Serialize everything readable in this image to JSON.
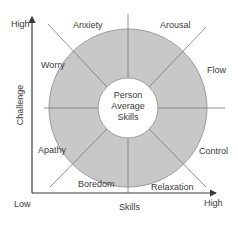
{
  "diagram": {
    "type": "flow-model-circle",
    "axes": {
      "y_label": "Challenge",
      "x_label": "Skills",
      "y_high": "High",
      "x_high": "High",
      "origin_low": "Low"
    },
    "center": {
      "line1": "Person",
      "line2": "Average",
      "line3": "Skills"
    },
    "segments": [
      {
        "label": "Anxiety"
      },
      {
        "label": "Arousal"
      },
      {
        "label": "Flow"
      },
      {
        "label": "Control"
      },
      {
        "label": "Relaxation"
      },
      {
        "label": "Boredom"
      },
      {
        "label": "Apathy"
      },
      {
        "label": "Worry"
      }
    ],
    "colors": {
      "ring_fill": "#c8c8c8",
      "ring_stroke": "#8a8a8a",
      "axis": "#3a3a3a",
      "radial_line": "#777777",
      "text": "#3a3a3a"
    }
  }
}
